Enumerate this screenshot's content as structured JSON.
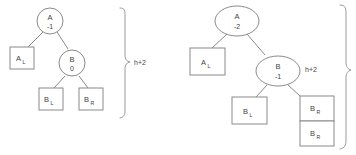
{
  "diagram": {
    "colors": {
      "stroke": "#8a8a8a",
      "text": "#3f3f3f",
      "background": "#ffffff"
    },
    "trees": [
      {
        "id": "left-tree",
        "root": {
          "key": "A",
          "balance": "-1"
        },
        "child": {
          "key": "B",
          "balance": "0"
        },
        "boxes": [
          {
            "id": "a-left",
            "label": "A",
            "subscript": "L"
          },
          {
            "id": "b-left",
            "label": "B",
            "subscript": "L"
          },
          {
            "id": "b-right",
            "label": "B",
            "subscript": "R"
          }
        ],
        "brace_label": "h+2"
      },
      {
        "id": "right-tree",
        "root": {
          "key": "A",
          "balance": "-2"
        },
        "child": {
          "key": "B",
          "balance": "-1"
        },
        "boxes": [
          {
            "id": "a-left",
            "label": "A",
            "subscript": "L"
          },
          {
            "id": "b-left",
            "label": "B",
            "subscript": "L"
          },
          {
            "id": "b-right-top",
            "label": "B",
            "subscript": "R"
          },
          {
            "id": "b-right-bottom",
            "label": "B",
            "subscript": "R"
          }
        ],
        "brace_label": "h+2"
      }
    ]
  }
}
